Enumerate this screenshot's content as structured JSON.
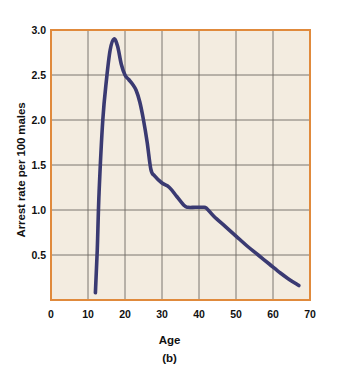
{
  "figure": {
    "caption": "(b)",
    "background_color": "#ffffff",
    "plot_background_color": "#f3ece0",
    "frame_color": "#e08a3c",
    "grid_color": "#6e6a63",
    "line_color": "#3a3a72",
    "text_color": "#111111"
  },
  "chart_data": {
    "type": "line",
    "title": "",
    "subtitle": "",
    "xlabel": "Age",
    "ylabel": "Arrest rate per 100 males",
    "xlim": [
      0,
      70
    ],
    "ylim": [
      0,
      3.0
    ],
    "xticks": [
      0,
      10,
      20,
      30,
      40,
      50,
      60,
      70
    ],
    "xtick_labels": [
      "0",
      "10",
      "20",
      "30",
      "40",
      "50",
      "60",
      "70"
    ],
    "yticks": [
      0.5,
      1.0,
      1.5,
      2.0,
      2.5,
      3.0
    ],
    "ytick_labels": [
      "0.5",
      "1.0",
      "1.5",
      "2.0",
      "2.5",
      "3.0"
    ],
    "grid": true,
    "grid_axes": "both",
    "legend": false,
    "legend_position": "none",
    "annotations": [],
    "series": [
      {
        "name": "Arrest rate per 100 males",
        "color": "#3a3a72",
        "x": [
          12,
          12.5,
          13,
          14,
          15,
          16,
          17,
          18,
          19,
          20,
          21,
          22,
          23,
          24,
          25,
          26,
          27,
          28,
          30,
          32,
          34,
          36,
          37,
          39,
          41,
          42,
          44,
          47,
          50,
          53,
          56,
          59,
          62,
          64,
          67
        ],
        "values": [
          0.08,
          0.55,
          1.2,
          2.0,
          2.45,
          2.78,
          2.9,
          2.82,
          2.62,
          2.5,
          2.45,
          2.4,
          2.33,
          2.2,
          2.0,
          1.75,
          1.45,
          1.38,
          1.3,
          1.25,
          1.15,
          1.05,
          1.03,
          1.03,
          1.03,
          1.02,
          0.93,
          0.82,
          0.71,
          0.6,
          0.5,
          0.4,
          0.3,
          0.24,
          0.16
        ]
      }
    ]
  }
}
